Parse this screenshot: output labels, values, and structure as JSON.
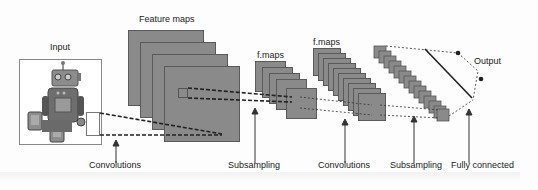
{
  "diagram": {
    "labels": {
      "input": "Input",
      "feature_maps": "Feature maps",
      "fmaps_1": "f.maps",
      "fmaps_2": "f.maps",
      "output": "Output"
    },
    "stages": [
      {
        "label": "Convolutions"
      },
      {
        "label": "Subsampling"
      },
      {
        "label": "Convolutions"
      },
      {
        "label": "Subsampling"
      },
      {
        "label": "Fully connected"
      }
    ],
    "colors": {
      "map_fill": "#8a8a8a",
      "map_border": "#5a5a5a",
      "line": "#222222",
      "background": "#fdfdfd"
    }
  }
}
